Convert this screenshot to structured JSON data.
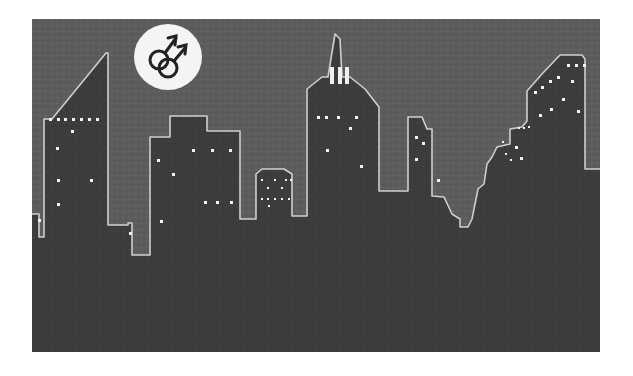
{
  "image": {
    "description": "Grayscale illustration of a night city skyline with lit windows and a white circle containing a double male gender symbol",
    "badge": {
      "icon": "double-male-symbol-icon",
      "label": "⚣"
    },
    "colors": {
      "sky": "#5e5e5e",
      "buildings": "#3a3a3a",
      "outline": "#cfcfcf",
      "windows": "#f2f2f2",
      "badge": "#f4f4f4",
      "symbol": "#222222"
    }
  }
}
